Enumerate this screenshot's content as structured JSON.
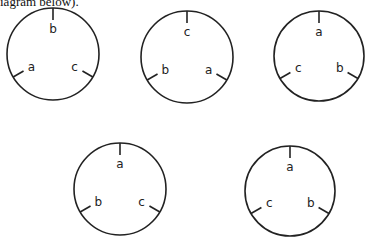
{
  "caption": "iagram below).",
  "circles": [
    {
      "id": 1,
      "cx": 53,
      "cy": 54,
      "r": 46,
      "labels": {
        "top": "b",
        "left": "a",
        "right": "c"
      }
    },
    {
      "id": 2,
      "cx": 187,
      "cy": 57,
      "r": 46,
      "labels": {
        "top": "c",
        "left": "b",
        "right": "a"
      }
    },
    {
      "id": 3,
      "cx": 319,
      "cy": 56,
      "r": 45,
      "labels": {
        "top": "a",
        "left": "c",
        "right": "b"
      }
    },
    {
      "id": 4,
      "cx": 120,
      "cy": 189,
      "r": 46,
      "labels": {
        "top": "a",
        "left": "b",
        "right": "c"
      }
    },
    {
      "id": 5,
      "cx": 290,
      "cy": 191,
      "r": 45,
      "labels": {
        "top": "a",
        "left": "c",
        "right": "b"
      }
    }
  ],
  "colors": {
    "stroke": "#222222",
    "background": "#ffffff"
  }
}
